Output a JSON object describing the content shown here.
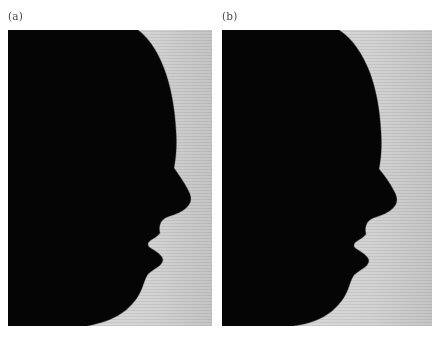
{
  "figure": {
    "background_color": "#ffffff",
    "panel_count": 2,
    "panels": [
      {
        "id": "a",
        "label": "(a)",
        "caption_text": "(a)",
        "silhouette_color": "#050505",
        "background_color": "#d4d4d4",
        "subject": "human-head-profile-silhouette",
        "facing": "right",
        "description_alt": "Black silhouette of a human head in right-facing profile against a light gray background"
      },
      {
        "id": "b",
        "label": "(b)",
        "caption_text": "(b)",
        "silhouette_color": "#050505",
        "background_color": "#d4d4d4",
        "subject": "human-head-profile-silhouette",
        "facing": "right",
        "description_alt": "Black silhouette of a human head in right-facing profile against a light gray background"
      }
    ],
    "colors": {
      "silhouette": "#050505",
      "panel_background": "#d4d4d4",
      "page_background": "#ffffff",
      "label_text": "#4a4a4a"
    }
  }
}
